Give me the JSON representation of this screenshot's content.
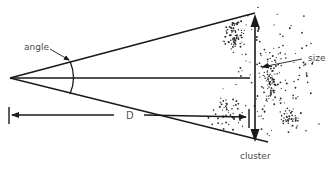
{
  "diagram": {
    "type": "angular-size-geometry",
    "labels": {
      "angle": "angle",
      "size": "size",
      "distance": "D",
      "cluster": "cluster"
    },
    "colors": {
      "line": "#1a1a1a",
      "text": "#4a4a4a",
      "dots": "#2a2a2a",
      "background": "#ffffff"
    },
    "elements": [
      {
        "id": "apex",
        "description": "observer point where lines converge"
      },
      {
        "id": "upper-ray",
        "description": "line from observer to top of cluster"
      },
      {
        "id": "lower-ray",
        "description": "line from observer to bottom of cluster"
      },
      {
        "id": "center-line",
        "description": "line from observer to cluster center"
      },
      {
        "id": "angle-arc",
        "description": "arc marking the subtended angle"
      },
      {
        "id": "size-arrow",
        "description": "double-headed vertical arrow spanning cluster"
      },
      {
        "id": "distance-arrow",
        "description": "arrow indicating distance D"
      },
      {
        "id": "cluster",
        "description": "scattered dots representing galaxy cluster"
      }
    ]
  }
}
